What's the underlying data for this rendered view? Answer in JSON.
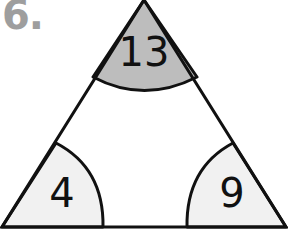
{
  "question": {
    "number_label": "6."
  },
  "triangle": {
    "colors": {
      "outline": "#111111",
      "top_angle_fill": "#bdbdbd",
      "bottom_angle_fill": "#f1f1f1",
      "background": "#ffffff"
    },
    "angles": {
      "top": {
        "value": "13"
      },
      "bottom_left": {
        "value": "4"
      },
      "bottom_right": {
        "value": "9"
      }
    }
  }
}
